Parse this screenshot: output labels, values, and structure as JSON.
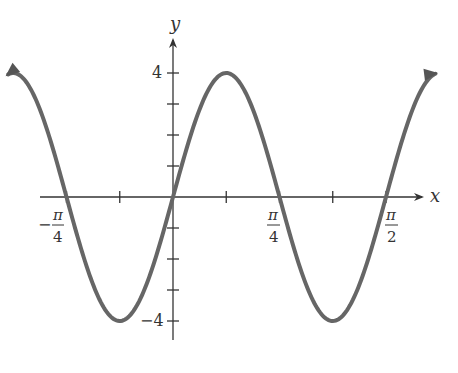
{
  "chart_data": {
    "type": "line",
    "title": "",
    "function": "y = 4 sin(4x)",
    "xlabel": "x",
    "ylabel": "y",
    "x_ticks": [
      {
        "value": -0.7854,
        "num": "π",
        "den": "4",
        "sign": "−"
      },
      {
        "value": 0.7854,
        "num": "π",
        "den": "4",
        "sign": ""
      },
      {
        "value": 1.5708,
        "num": "π",
        "den": "2",
        "sign": ""
      }
    ],
    "y_tick_labels": [
      {
        "value": 4,
        "label": "4"
      },
      {
        "value": -4,
        "label": "−4"
      }
    ],
    "y_ticks": [
      -4,
      -3,
      -2,
      -1,
      1,
      2,
      3,
      4
    ],
    "x_minor_ticks": [
      -0.3927,
      0.3927,
      1.1781
    ],
    "xlim": [
      -1.0,
      1.77
    ],
    "ylim": [
      -4.3,
      4.8
    ],
    "amplitude": 4,
    "period": 1.5708,
    "grid": false,
    "legend": null,
    "curve_color": "#666666",
    "axis_color": "#333333"
  }
}
